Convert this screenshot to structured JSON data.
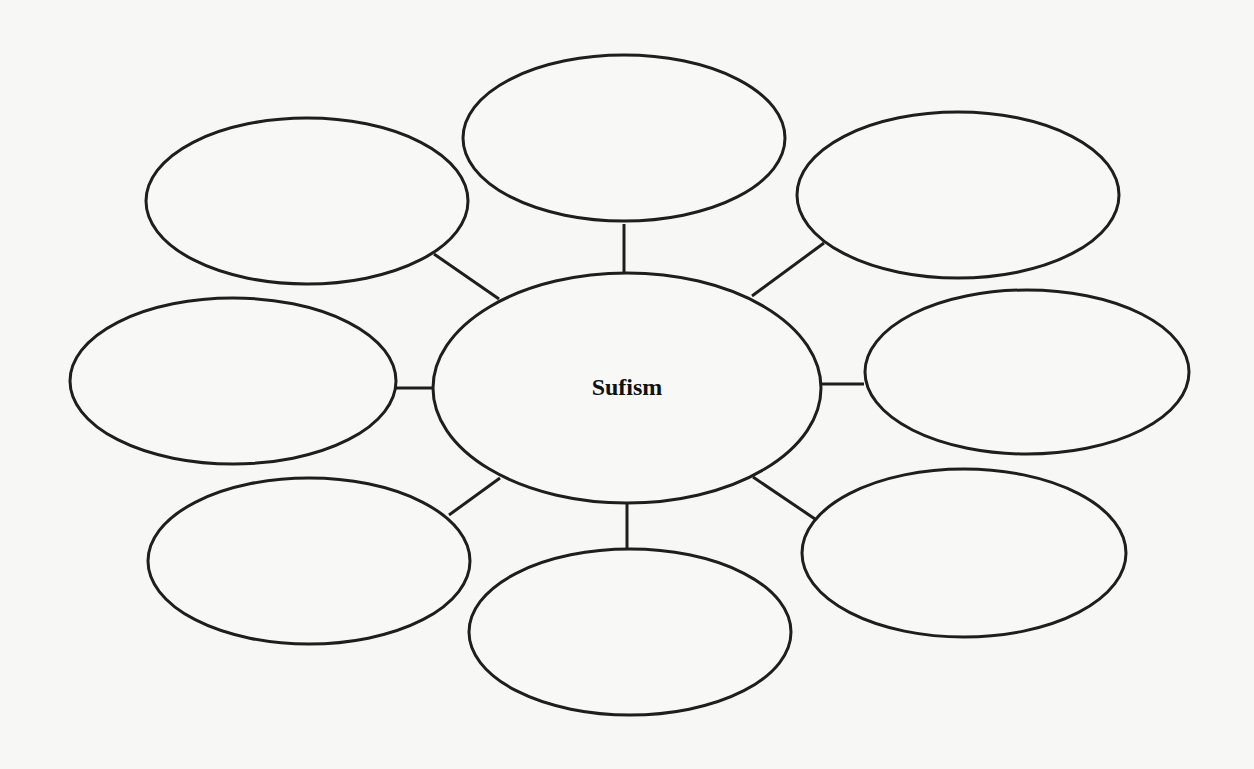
{
  "diagram": {
    "type": "bubble-map",
    "center": {
      "label": "Sufism",
      "cx": 627,
      "cy": 388,
      "rx": 194,
      "ry": 115
    },
    "satellites": [
      {
        "id": "top",
        "label": "",
        "cx": 624,
        "cy": 138,
        "rx": 161,
        "ry": 83,
        "line": [
          624,
          224,
          624,
          273
        ]
      },
      {
        "id": "top-right",
        "label": "",
        "cx": 958,
        "cy": 195,
        "rx": 161,
        "ry": 83,
        "line": [
          824,
          243,
          752,
          296
        ]
      },
      {
        "id": "right",
        "label": "",
        "cx": 1027,
        "cy": 372,
        "rx": 162,
        "ry": 82,
        "line": [
          822,
          384,
          864,
          384
        ]
      },
      {
        "id": "bottom-right",
        "label": "",
        "cx": 964,
        "cy": 553,
        "rx": 162,
        "ry": 84,
        "line": [
          753,
          477,
          815,
          519
        ]
      },
      {
        "id": "bottom",
        "label": "",
        "cx": 630,
        "cy": 632,
        "rx": 161,
        "ry": 83,
        "line": [
          627,
          503,
          627,
          549
        ]
      },
      {
        "id": "bottom-left",
        "label": "",
        "cx": 309,
        "cy": 561,
        "rx": 161,
        "ry": 83,
        "line": [
          500,
          478,
          449,
          515
        ]
      },
      {
        "id": "left",
        "label": "",
        "cx": 233,
        "cy": 381,
        "rx": 163,
        "ry": 83,
        "line": [
          395,
          388,
          434,
          388
        ]
      },
      {
        "id": "top-left",
        "label": "",
        "cx": 307,
        "cy": 201,
        "rx": 161,
        "ry": 83,
        "line": [
          434,
          254,
          499,
          299
        ]
      }
    ],
    "colors": {
      "stroke": "#1e1e1e",
      "background": "#f7f7f5",
      "text": "#111111"
    }
  }
}
